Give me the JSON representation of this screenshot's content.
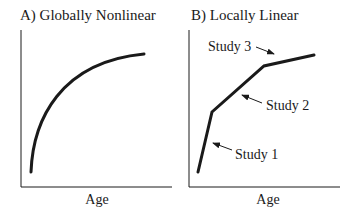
{
  "panels": [
    {
      "id": "A",
      "title": "A) Globally Nonlinear",
      "xlabel": "Age",
      "curve": "concave increasing (decelerating) nonlinear curve"
    },
    {
      "id": "B",
      "title": "B) Locally Linear",
      "xlabel": "Age",
      "segments": [
        {
          "label": "Study 1",
          "description": "steep linear segment"
        },
        {
          "label": "Study 2",
          "description": "moderate-slope linear segment"
        },
        {
          "label": "Study 3",
          "description": "shallow linear segment"
        }
      ]
    }
  ],
  "colors": {
    "ink": "#1a1a1a",
    "background": "#ffffff"
  }
}
